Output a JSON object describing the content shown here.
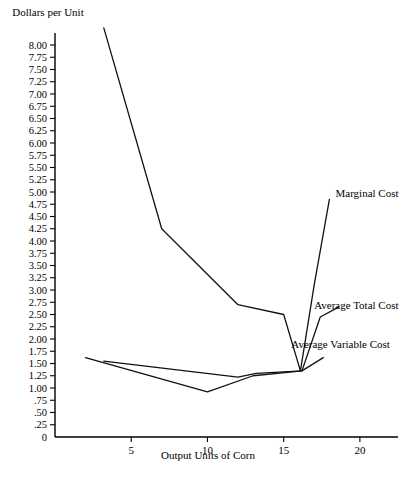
{
  "chart_data": {
    "type": "line",
    "title": "",
    "ylabel": "Dollars per Unit",
    "xlabel": "Output Units of Corn",
    "xlim": [
      0,
      22.5
    ],
    "ylim": [
      0,
      8.5
    ],
    "grid": false,
    "legend_position": "inline-right-of-curves",
    "x_ticks": [
      5,
      10,
      15,
      20
    ],
    "x_tick_labels": [
      "5",
      "10",
      "15",
      "20"
    ],
    "y_ticks": [
      0,
      0.25,
      0.5,
      0.75,
      1.0,
      1.25,
      1.5,
      1.75,
      2.0,
      2.25,
      2.5,
      2.75,
      3.0,
      3.25,
      3.5,
      3.75,
      4.0,
      4.25,
      4.5,
      4.75,
      5.0,
      5.25,
      5.5,
      5.75,
      6.0,
      6.25,
      6.5,
      6.75,
      7.0,
      7.25,
      7.5,
      7.75,
      8.0
    ],
    "y_tick_labels": [
      "0",
      ".25",
      ".50",
      ".75",
      "1.00",
      "1.25",
      "1.50",
      "1.75",
      "2.00",
      "2.25",
      "2.50",
      "2.75",
      "3.00",
      "3.25",
      "3.50",
      "3.75",
      "4.00",
      "4.25",
      "4.50",
      "4.75",
      "5.00",
      "5.25",
      "5.50",
      "5.75",
      "6.00",
      "6.25",
      "6.50",
      "6.75",
      "7.00",
      "7.25",
      "7.50",
      "7.75",
      "8.00"
    ],
    "series": [
      {
        "name": "Marginal Cost",
        "label": "Marginal Cost",
        "color": "#111111",
        "points": [
          [
            3.2,
            8.35
          ],
          [
            7.0,
            4.25
          ],
          [
            12.0,
            2.7
          ],
          [
            15.0,
            2.5
          ],
          [
            16.1,
            1.35
          ],
          [
            17.0,
            3.1
          ],
          [
            18.0,
            4.85
          ]
        ]
      },
      {
        "name": "Average Total Cost",
        "label": "Average Total Cost",
        "color": "#111111",
        "points": [
          [
            2.0,
            1.62
          ],
          [
            10.0,
            0.92
          ],
          [
            13.0,
            1.25
          ],
          [
            16.2,
            1.35
          ],
          [
            17.4,
            2.45
          ],
          [
            18.6,
            2.65
          ]
        ]
      },
      {
        "name": "Average Variable Cost",
        "label": "Average Variable Cost",
        "color": "#111111",
        "points": [
          [
            3.2,
            1.55
          ],
          [
            12.0,
            1.22
          ],
          [
            13.2,
            1.3
          ],
          [
            16.2,
            1.35
          ],
          [
            17.6,
            1.62
          ]
        ]
      }
    ],
    "annotations": [
      {
        "text": "Marginal Cost",
        "x": 18.4,
        "y": 4.9
      },
      {
        "text": "Average Total Cost",
        "x": 17.0,
        "y": 2.62
      },
      {
        "text": "Average Variable Cost",
        "x": 15.5,
        "y": 1.82
      }
    ]
  }
}
